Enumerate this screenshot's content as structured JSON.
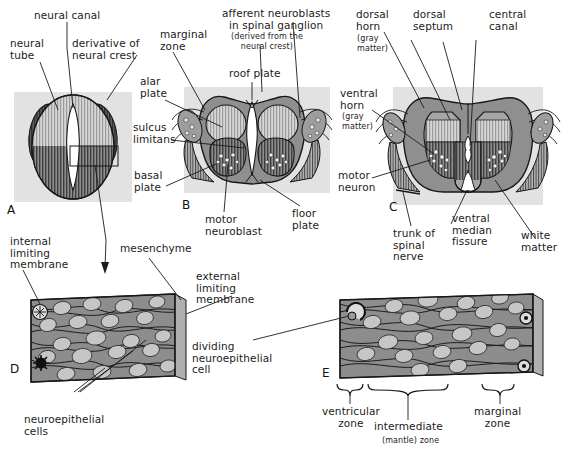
{
  "figure": {
    "panels": [
      "A",
      "B",
      "C",
      "D",
      "E"
    ]
  },
  "panelA": {
    "letter": "A",
    "labels": [
      {
        "id": "neural-canal",
        "text": "neural canal"
      },
      {
        "id": "neural-tube",
        "text": "neural\ntube"
      },
      {
        "id": "derivative-of-neural-crest",
        "text": "derivative of\nneural crest"
      }
    ]
  },
  "panelB": {
    "letter": "B",
    "labels": [
      {
        "id": "marginal-zone",
        "text": "marginal\nzone"
      },
      {
        "id": "alar-plate",
        "text": "alar\nplate"
      },
      {
        "id": "sulcus-limitans",
        "text": "sulcus\nlimitans"
      },
      {
        "id": "basal-plate",
        "text": "basal\nplate"
      },
      {
        "id": "afferent-neuroblasts",
        "text": "afferent neuroblasts\nin spinal ganglion"
      },
      {
        "id": "afferent-neuroblasts-note",
        "text": "(derived from the\nneural crest)"
      },
      {
        "id": "roof-plate",
        "text": "roof plate"
      },
      {
        "id": "motor-neuroblast",
        "text": "motor\nneuroblast"
      },
      {
        "id": "floor-plate",
        "text": "floor\nplate"
      }
    ]
  },
  "panelC": {
    "letter": "C",
    "labels": [
      {
        "id": "dorsal-horn",
        "text": "dorsal\nhorn"
      },
      {
        "id": "dorsal-horn-note",
        "text": "(gray\nmatter)"
      },
      {
        "id": "dorsal-septum",
        "text": "dorsal\nseptum"
      },
      {
        "id": "central-canal",
        "text": "central\ncanal"
      },
      {
        "id": "ventral-horn",
        "text": "ventral\nhorn"
      },
      {
        "id": "ventral-horn-note",
        "text": "(gray\nmatter)"
      },
      {
        "id": "motor-neuron",
        "text": "motor\nneuron"
      },
      {
        "id": "trunk-of-spinal-nerve",
        "text": "trunk of\nspinal\nnerve"
      },
      {
        "id": "ventral-median-fissure",
        "text": "ventral\nmedian\nfissure"
      },
      {
        "id": "white-matter",
        "text": "white\nmatter"
      }
    ]
  },
  "panelD": {
    "letter": "D",
    "labels": [
      {
        "id": "internal-limiting-membrane",
        "text": "internal\nlimiting\nmembrane"
      },
      {
        "id": "mesenchyme",
        "text": "mesenchyme"
      },
      {
        "id": "external-limiting-membrane",
        "text": "external\nlimiting\nmembrane"
      },
      {
        "id": "dividing-neuroepithelial-cell",
        "text": "dividing\nneuroepithelial\ncell"
      },
      {
        "id": "neuroepithelial-cells",
        "text": "neuroepithelial\ncells"
      }
    ]
  },
  "panelE": {
    "letter": "E",
    "labels": [
      {
        "id": "ventricular-zone",
        "text": "ventricular\nzone"
      },
      {
        "id": "intermediate-zone",
        "text": "intermediate"
      },
      {
        "id": "intermediate-zone-note",
        "text": "(mantle) zone"
      },
      {
        "id": "marginal-zone",
        "text": "marginal\nzone"
      }
    ]
  },
  "colors": {
    "plate_background": "#e2e2e2",
    "tissue_gray": "#8d8d8d",
    "tissue_mid": "#9a9a9a",
    "nucleus_light": "#c9c9c9",
    "dark_hatch": "#4a4a4a",
    "light_hatch": "#cfcfcf",
    "outline": "#1b1b1b",
    "canal_white": "#ffffff",
    "text": "#1b1b1b"
  }
}
